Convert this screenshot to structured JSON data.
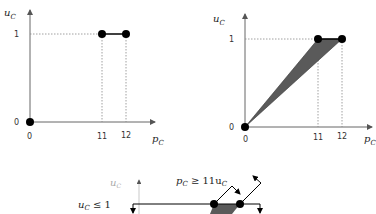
{
  "panels": [
    {
      "id": "left",
      "y_axis_label": "u",
      "y_axis_sub": "C",
      "x_axis_label": "p",
      "x_axis_sub": "C",
      "y_ticks": [
        "0",
        "1"
      ],
      "x_ticks": [
        "0",
        "11",
        "12"
      ],
      "points": [
        [
          0,
          0
        ],
        [
          11,
          1
        ],
        [
          12,
          1
        ]
      ],
      "segment": [
        [
          11,
          1
        ],
        [
          12,
          1
        ]
      ]
    },
    {
      "id": "right",
      "y_axis_label": "u",
      "y_axis_sub": "C",
      "x_axis_label": "p",
      "x_axis_sub": "C",
      "y_ticks": [
        "0",
        "1"
      ],
      "x_ticks": [
        "0",
        "11",
        "12"
      ],
      "points": [
        [
          0,
          0
        ],
        [
          11,
          1
        ],
        [
          12,
          1
        ]
      ],
      "shaded_region": [
        [
          0,
          0
        ],
        [
          11,
          1
        ],
        [
          12,
          1
        ]
      ]
    },
    {
      "id": "bottom",
      "y_axis_label": "u",
      "y_axis_sub": "C",
      "constraint_1": "u",
      "constraint_1_sub": "C",
      "constraint_1_rel": " ≤ 1",
      "constraint_2_p": "p",
      "constraint_2_psub": "C",
      "constraint_2_rel": " ≥ 11u",
      "constraint_2_usub": "C"
    }
  ],
  "colors": {
    "axis": "#666666",
    "point": "#000000",
    "shade": "#555555",
    "dotted": "#888888"
  }
}
